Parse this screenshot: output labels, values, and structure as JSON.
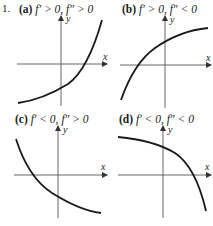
{
  "problem_number": "1.",
  "panels": [
    {
      "id": "a",
      "tag": "(a)",
      "condition_1": "f′ > 0,",
      "condition_2": "f″ > 0",
      "x_label": "x",
      "y_label": "y",
      "description": "increasing, concave up"
    },
    {
      "id": "b",
      "tag": "(b)",
      "condition_1": "f′ > 0,",
      "condition_2": "f″ < 0",
      "x_label": "x",
      "y_label": "y",
      "description": "increasing, concave down"
    },
    {
      "id": "c",
      "tag": "(c)",
      "condition_1": "f′ < 0,",
      "condition_2": "f″ > 0",
      "x_label": "x",
      "y_label": "y",
      "description": "decreasing, concave up"
    },
    {
      "id": "d",
      "tag": "(d)",
      "condition_1": "f′ < 0,",
      "condition_2": "f″ < 0",
      "x_label": "x",
      "y_label": "y",
      "description": "decreasing, concave down"
    }
  ],
  "colors": {
    "ink": "#1a1a1a",
    "axis": "#444444",
    "background": "#ffffff"
  }
}
